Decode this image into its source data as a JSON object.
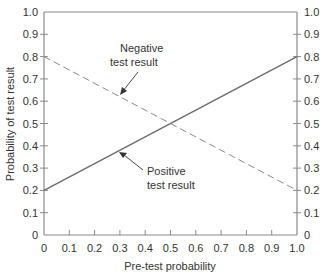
{
  "chart_data": {
    "type": "line",
    "title": "",
    "xlabel": "Pre-test probability",
    "ylabel": "Probability of test result",
    "xlim": [
      0,
      1.0
    ],
    "ylim": [
      0,
      1.0
    ],
    "x_ticks": [
      "0",
      "0.1",
      "0.2",
      "0.3",
      "0.4",
      "0.5",
      "0.6",
      "0.7",
      "0.8",
      "0.9",
      "1.0"
    ],
    "y_ticks": [
      "0",
      "0.1",
      "0.2",
      "0.3",
      "0.4",
      "0.5",
      "0.6",
      "0.7",
      "0.8",
      "0.9",
      "1.0"
    ],
    "right_y_ticks": [
      "0",
      "0.1",
      "0.2",
      "0.3",
      "0.4",
      "0.5",
      "0.6",
      "0.7",
      "0.8",
      "0.9",
      "1.0"
    ],
    "grid": false,
    "legend": null,
    "series": [
      {
        "name": "Positive test result",
        "style": "solid",
        "x": [
          0,
          1.0
        ],
        "y": [
          0.2,
          0.8
        ]
      },
      {
        "name": "Negative test result",
        "style": "dashed",
        "x": [
          0,
          1.0
        ],
        "y": [
          0.8,
          0.2
        ]
      }
    ],
    "annotations": [
      {
        "text_lines": [
          "Negative",
          "test result"
        ],
        "points_to": "Negative test result",
        "at": [
          0.3,
          0.62
        ]
      },
      {
        "text_lines": [
          "Positive",
          "test result"
        ],
        "points_to": "Positive test result",
        "at": [
          0.25,
          0.35
        ]
      }
    ]
  },
  "labels": {
    "xlabel": "Pre-test probability",
    "ylabel": "Probability of test result",
    "neg_line1": "Negative",
    "neg_line2": "test result",
    "pos_line1": "Positive",
    "pos_line2": "test result"
  },
  "colors": {
    "axis": "#8a8a8a",
    "line": "#6e6e6e",
    "text": "#333333"
  }
}
